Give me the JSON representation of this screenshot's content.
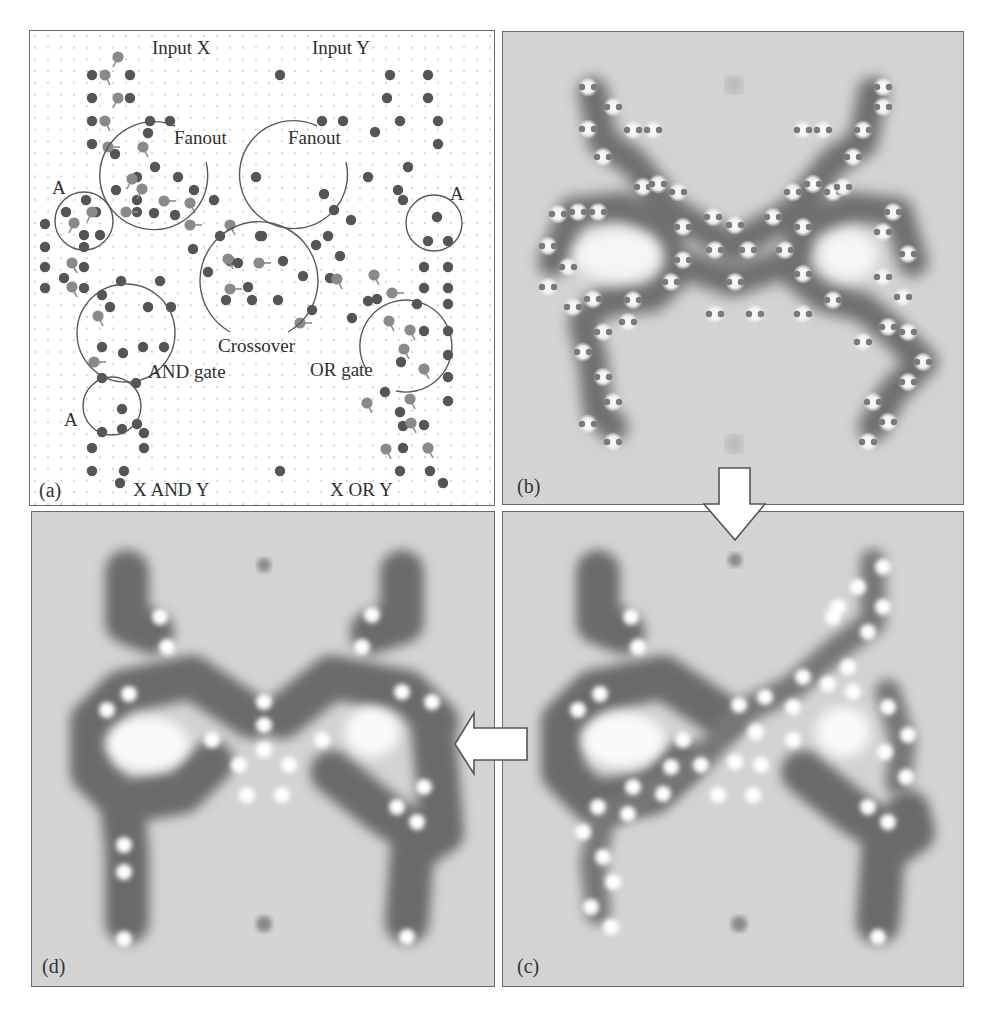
{
  "figure": {
    "panels": [
      {
        "id": "a",
        "letter": "(a)",
        "type": "schematic-layout"
      },
      {
        "id": "b",
        "letter": "(b)",
        "type": "stm-image"
      },
      {
        "id": "c",
        "letter": "(c)",
        "type": "stm-image"
      },
      {
        "id": "d",
        "letter": "(d)",
        "type": "stm-image"
      }
    ],
    "panel_a_labels": {
      "input_x": "Input X",
      "input_y": "Input Y",
      "fanout_left": "Fanout",
      "fanout_right": "Fanout",
      "a_top_left": "A",
      "a_top_right": "A",
      "a_bottom_left": "A",
      "crossover": "Crossover",
      "and_gate": "AND gate",
      "or_gate": "OR gate",
      "output_and": "X AND Y",
      "output_or": "X OR Y"
    },
    "arrows": [
      {
        "name": "b-to-c",
        "direction": "down"
      },
      {
        "name": "c-to-d",
        "direction": "left"
      }
    ],
    "colors": {
      "panel_border": "#6a6a6a",
      "grid_dot": "#b8b8b8",
      "molecule_dark": "#555555",
      "molecule_tilted": "#888888",
      "stm_background": "#d2d2d2",
      "stm_cascade_dark": "#6a6a6a",
      "stm_bright": "#ffffff",
      "arrow_fill": "#ffffff"
    }
  }
}
